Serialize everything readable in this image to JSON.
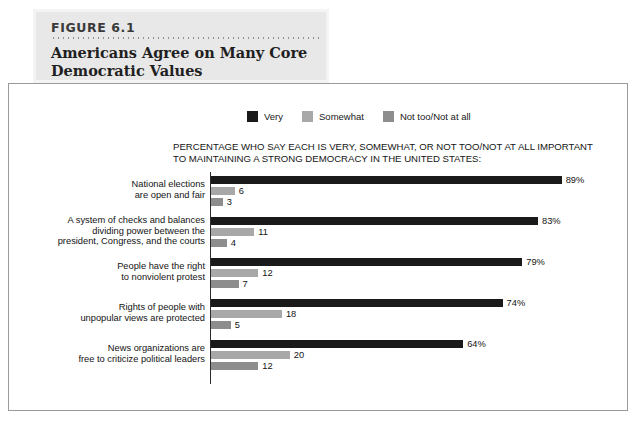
{
  "header": {
    "figure_number": "FIGURE 6.1",
    "title_line1": "Americans Agree on Many Core",
    "title_line2": "Democratic Values"
  },
  "colors": {
    "very": "#1a1a1a",
    "somewhat": "#a8a8a8",
    "not_too": "#8d8d8d",
    "axis": "#2a2a2a",
    "frame": "#9a9a9a",
    "header_panel": "#e8e8e8"
  },
  "legend": {
    "items": [
      {
        "label": "Very",
        "color": "#1a1a1a",
        "key": "very"
      },
      {
        "label": "Somewhat",
        "color": "#a8a8a8",
        "key": "somewhat"
      },
      {
        "label": "Not too/Not at all",
        "color": "#8d8d8d",
        "key": "not_too"
      }
    ]
  },
  "subtitle": "PERCENTAGE WHO SAY EACH IS VERY, SOMEWHAT, OR NOT TOO/NOT AT ALL IMPORTANT TO MAINTAINING A STRONG DEMOCRACY IN THE UNITED STATES:",
  "chart_data": {
    "type": "bar",
    "orientation": "horizontal",
    "grouped": true,
    "title": "Americans Agree on Many Core Democratic Values",
    "subtitle": "PERCENTAGE WHO SAY EACH IS VERY, SOMEWHAT, OR NOT TOO/NOT AT ALL IMPORTANT TO MAINTAINING A STRONG DEMOCRACY IN THE UNITED STATES:",
    "xlabel": "",
    "ylabel": "",
    "xlim": [
      0,
      100
    ],
    "grid": false,
    "legend_position": "top",
    "categories": [
      "National elections are open and fair",
      "A system of checks and balances dividing power between the president, Congress, and the courts",
      "People have the right to nonviolent protest",
      "Rights of people with unpopular views are protected",
      "News organizations are free to criticize political leaders"
    ],
    "series": [
      {
        "name": "Very",
        "values": [
          89,
          83,
          79,
          74,
          64
        ]
      },
      {
        "name": "Somewhat",
        "values": [
          6,
          11,
          12,
          18,
          20
        ]
      },
      {
        "name": "Not too/Not at all",
        "values": [
          3,
          4,
          7,
          5,
          12
        ]
      }
    ]
  },
  "groups": [
    {
      "label_lines": [
        "National elections",
        "are open and fair"
      ],
      "bars": [
        {
          "series": "Very",
          "value": 89,
          "display": "89%",
          "color": "#1a1a1a"
        },
        {
          "series": "Somewhat",
          "value": 6,
          "display": "6",
          "color": "#a8a8a8"
        },
        {
          "series": "Not too/Not at all",
          "value": 3,
          "display": "3",
          "color": "#8d8d8d"
        }
      ]
    },
    {
      "label_lines": [
        "A system of checks and balances",
        "dividing power between the",
        "president, Congress, and the courts"
      ],
      "bars": [
        {
          "series": "Very",
          "value": 83,
          "display": "83%",
          "color": "#1a1a1a"
        },
        {
          "series": "Somewhat",
          "value": 11,
          "display": "11",
          "color": "#a8a8a8"
        },
        {
          "series": "Not too/Not at all",
          "value": 4,
          "display": "4",
          "color": "#8d8d8d"
        }
      ]
    },
    {
      "label_lines": [
        "People have the right",
        "to nonviolent protest"
      ],
      "bars": [
        {
          "series": "Very",
          "value": 79,
          "display": "79%",
          "color": "#1a1a1a"
        },
        {
          "series": "Somewhat",
          "value": 12,
          "display": "12",
          "color": "#a8a8a8"
        },
        {
          "series": "Not too/Not at all",
          "value": 7,
          "display": "7",
          "color": "#8d8d8d"
        }
      ]
    },
    {
      "label_lines": [
        "Rights of people with",
        "unpopular views are protected"
      ],
      "bars": [
        {
          "series": "Very",
          "value": 74,
          "display": "74%",
          "color": "#1a1a1a"
        },
        {
          "series": "Somewhat",
          "value": 18,
          "display": "18",
          "color": "#a8a8a8"
        },
        {
          "series": "Not too/Not at all",
          "value": 5,
          "display": "5",
          "color": "#8d8d8d"
        }
      ]
    },
    {
      "label_lines": [
        "News organizations are",
        "free to criticize political leaders"
      ],
      "bars": [
        {
          "series": "Very",
          "value": 64,
          "display": "64%",
          "color": "#1a1a1a"
        },
        {
          "series": "Somewhat",
          "value": 20,
          "display": "20",
          "color": "#a8a8a8"
        },
        {
          "series": "Not too/Not at all",
          "value": 12,
          "display": "12",
          "color": "#8d8d8d"
        }
      ]
    }
  ],
  "scale": {
    "px_per_percent": 3.94,
    "group_spacing": 41,
    "first_group_top": 4,
    "bar_height": 8,
    "bar_gap": 3
  }
}
